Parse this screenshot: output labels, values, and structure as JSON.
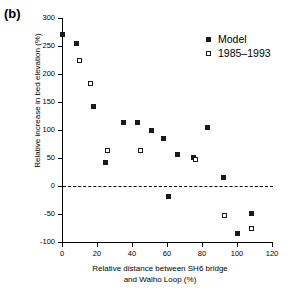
{
  "panel": {
    "label": "(b)"
  },
  "chart_data": {
    "type": "scatter",
    "title": "",
    "xlabel": "Relative distance between SH6 bridge and Waiho Loop (%)",
    "xlabel_line1": "Relative distance between SH6 bridge",
    "xlabel_line2": "and Waiho Loop (%)",
    "ylabel": "Relative increase in bed elevation (%)",
    "xlim": [
      0,
      120
    ],
    "ylim": [
      -100,
      300
    ],
    "xticks": [
      0,
      20,
      40,
      60,
      80,
      100,
      120
    ],
    "yticks": [
      -100,
      -50,
      0,
      50,
      100,
      150,
      200,
      250,
      300
    ],
    "grid": false,
    "zero_reference_line": 0,
    "legend_position": "top-right",
    "series": [
      {
        "name": "Model",
        "marker": "filled-square",
        "color": "#1a1a1a",
        "points": [
          {
            "x": 0,
            "y": 270
          },
          {
            "x": 8,
            "y": 255
          },
          {
            "x": 18,
            "y": 142
          },
          {
            "x": 25,
            "y": 42
          },
          {
            "x": 35,
            "y": 113
          },
          {
            "x": 43,
            "y": 113
          },
          {
            "x": 51,
            "y": 99
          },
          {
            "x": 58,
            "y": 85
          },
          {
            "x": 61,
            "y": -18
          },
          {
            "x": 66,
            "y": 57
          },
          {
            "x": 75,
            "y": 51
          },
          {
            "x": 83,
            "y": 104
          },
          {
            "x": 92,
            "y": 15
          },
          {
            "x": 100,
            "y": -85
          },
          {
            "x": 108,
            "y": -49
          }
        ]
      },
      {
        "name": "1985–1993",
        "marker": "open-square",
        "color": "#1a1a1a",
        "points": [
          {
            "x": 10,
            "y": 225
          },
          {
            "x": 16,
            "y": 183
          },
          {
            "x": 26,
            "y": 64
          },
          {
            "x": 45,
            "y": 64
          },
          {
            "x": 76,
            "y": 47
          },
          {
            "x": 93,
            "y": -53
          },
          {
            "x": 108,
            "y": -75
          }
        ]
      }
    ]
  }
}
